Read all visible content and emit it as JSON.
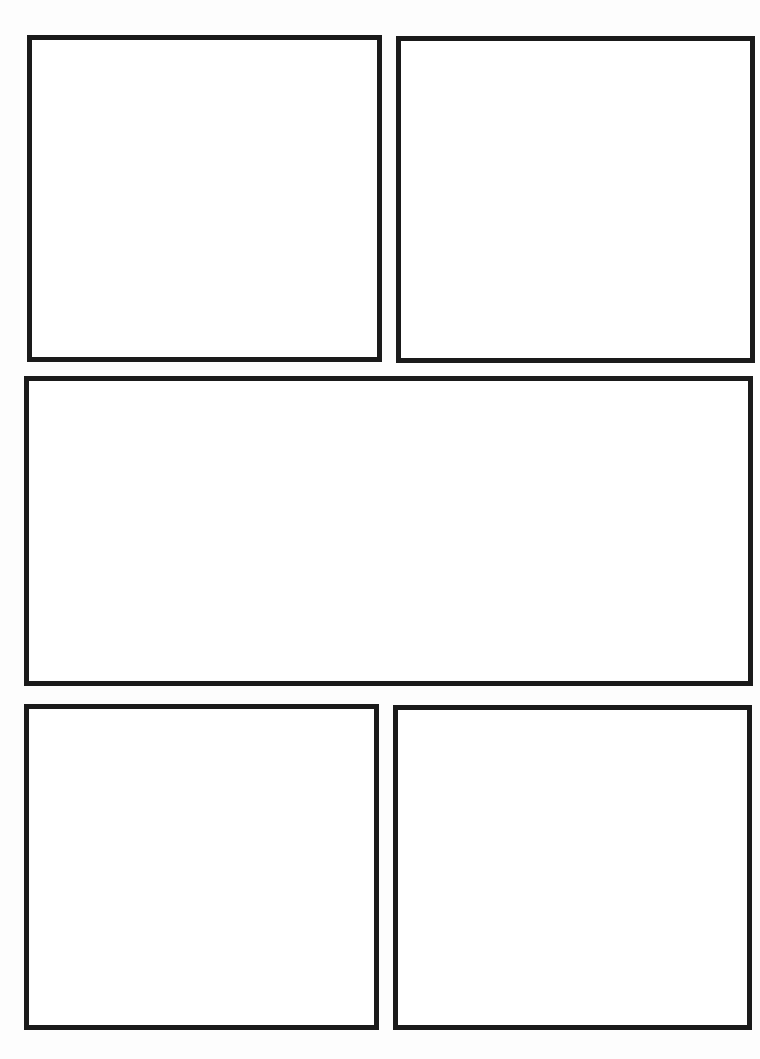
{
  "page": {
    "type": "comic-page-template",
    "background": "#fdfdfd",
    "border_color": "#1a1a1a",
    "border_width": 5
  },
  "panels": [
    {
      "id": "panel-1",
      "row": 1,
      "position": "top-left",
      "x": 27,
      "y": 35,
      "w": 355,
      "h": 327
    },
    {
      "id": "panel-2",
      "row": 1,
      "position": "top-right",
      "x": 396,
      "y": 36,
      "w": 359,
      "h": 327
    },
    {
      "id": "panel-3",
      "row": 2,
      "position": "middle-wide",
      "x": 24,
      "y": 376,
      "w": 729,
      "h": 310
    },
    {
      "id": "panel-4",
      "row": 3,
      "position": "bottom-left",
      "x": 24,
      "y": 704,
      "w": 355,
      "h": 326
    },
    {
      "id": "panel-5",
      "row": 3,
      "position": "bottom-right",
      "x": 393,
      "y": 705,
      "w": 359,
      "h": 325
    }
  ]
}
